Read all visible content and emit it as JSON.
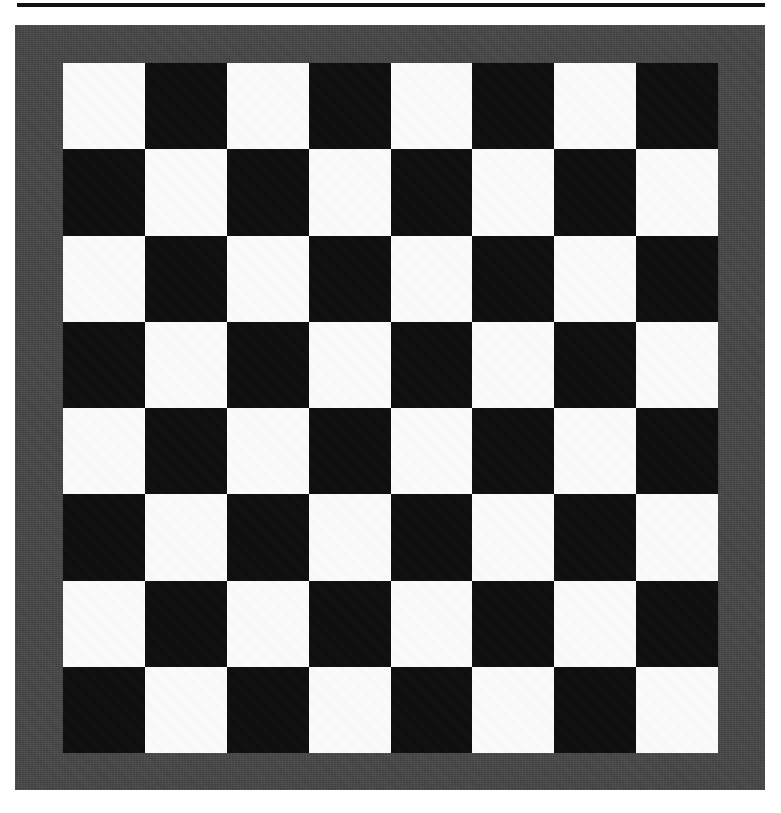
{
  "page": {
    "background_color": "#ffffff",
    "width": 781,
    "height": 813
  },
  "top_rule": {
    "color": "#111111",
    "thickness_px": 4
  },
  "board": {
    "caption": "",
    "frame_color": "#454545",
    "light_square_color": "#fcfcfc",
    "dark_square_color": "#0d0d0d",
    "rows": 8,
    "columns": 8,
    "top_left_square": "light",
    "squares": [
      [
        "light",
        "dark",
        "light",
        "dark",
        "light",
        "dark",
        "light",
        "dark"
      ],
      [
        "dark",
        "light",
        "dark",
        "light",
        "dark",
        "light",
        "dark",
        "light"
      ],
      [
        "light",
        "dark",
        "light",
        "dark",
        "light",
        "dark",
        "light",
        "dark"
      ],
      [
        "dark",
        "light",
        "dark",
        "light",
        "dark",
        "light",
        "dark",
        "light"
      ],
      [
        "light",
        "dark",
        "light",
        "dark",
        "light",
        "dark",
        "light",
        "dark"
      ],
      [
        "dark",
        "light",
        "dark",
        "light",
        "dark",
        "light",
        "dark",
        "light"
      ],
      [
        "light",
        "dark",
        "light",
        "dark",
        "light",
        "dark",
        "light",
        "dark"
      ],
      [
        "dark",
        "light",
        "dark",
        "light",
        "dark",
        "light",
        "dark",
        "light"
      ]
    ]
  }
}
